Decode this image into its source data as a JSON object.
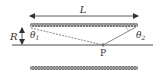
{
  "diagram": {
    "labels": {
      "length": "L",
      "radius": "R",
      "theta1": "θ",
      "theta1_sub": "1",
      "theta2": "θ",
      "theta2_sub": "2",
      "point": "P"
    },
    "colors": {
      "line": "#333333",
      "coil": "#555555",
      "coil_fill": "#a8a8a8"
    }
  }
}
